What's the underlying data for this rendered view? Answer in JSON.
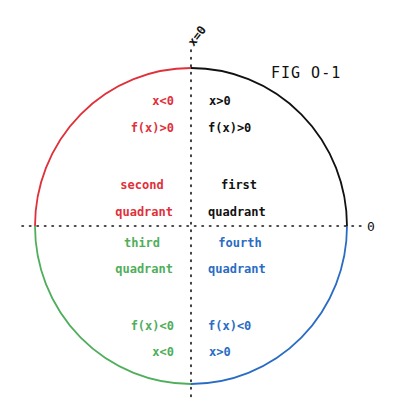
{
  "figure": {
    "title": "FIG O-1",
    "vertical_axis_label": "x=0",
    "horizontal_axis_label": "0",
    "center": [
      191,
      226
    ],
    "radius": 156
  },
  "colors": {
    "first": "#111111",
    "second": "#e0303a",
    "third": "#4fae5a",
    "fourth": "#2a6cc4",
    "axis": "#111111"
  },
  "quadrants": {
    "first": {
      "name_line1": "first",
      "name_line2": "quadrant",
      "x_condition": "x>0",
      "fx_condition": "f(x)>0"
    },
    "second": {
      "name_line1": "second",
      "name_line2": "quadrant",
      "x_condition": "x<0",
      "fx_condition": "f(x)>0"
    },
    "third": {
      "name_line1": "third",
      "name_line2": "quadrant",
      "x_condition": "x<0",
      "fx_condition": "f(x)<0"
    },
    "fourth": {
      "name_line1": "fourth",
      "name_line2": "quadrant",
      "x_condition": "x>0",
      "fx_condition": "f(x)<0"
    }
  }
}
